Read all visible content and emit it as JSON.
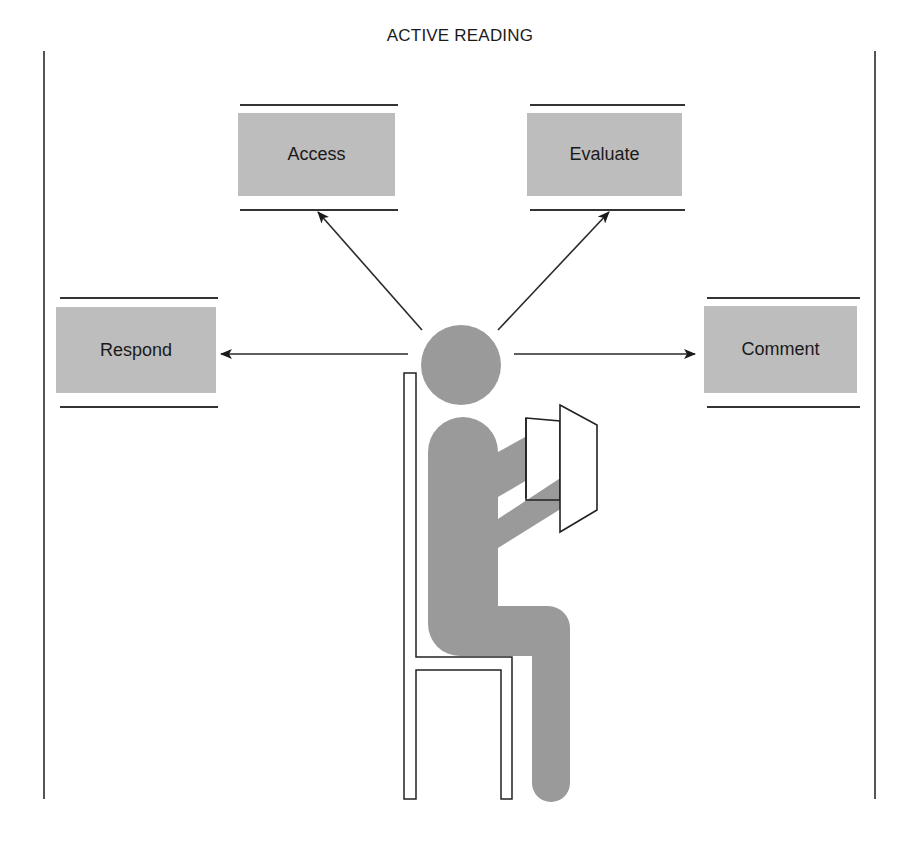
{
  "title": "ACTIVE READING",
  "nodes": [
    {
      "id": "access",
      "label": "Access"
    },
    {
      "id": "evaluate",
      "label": "Evaluate"
    },
    {
      "id": "respond",
      "label": "Respond"
    },
    {
      "id": "comment",
      "label": "Comment"
    }
  ],
  "center": {
    "label": "Seated reader figure"
  },
  "colors": {
    "box_fill": "#bdbdbd",
    "figure_fill": "#9a9a9a",
    "line": "#333333"
  }
}
